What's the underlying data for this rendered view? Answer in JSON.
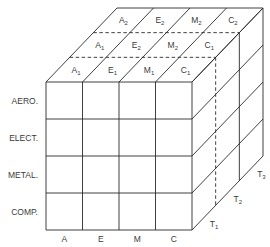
{
  "diagram": {
    "type": "3d-cube-matrix",
    "row_labels": [
      "AERO.",
      "ELECT.",
      "METAL.",
      "COMP."
    ],
    "column_labels": [
      "A",
      "E",
      "M",
      "C"
    ],
    "depth_labels": [
      {
        "base": "T",
        "sub": "1"
      },
      {
        "base": "T",
        "sub": "2"
      },
      {
        "base": "T",
        "sub": "3"
      }
    ],
    "top_layers": [
      {
        "cells": [
          {
            "base": "A",
            "sub": "1"
          },
          {
            "base": "E",
            "sub": "1"
          },
          {
            "base": "M",
            "sub": "1"
          },
          {
            "base": "C",
            "sub": "1"
          }
        ]
      },
      {
        "cells": [
          {
            "base": "A",
            "sub": "1"
          },
          {
            "base": "E",
            "sub": "2"
          },
          {
            "base": "M",
            "sub": "2"
          },
          {
            "base": "C",
            "sub": "1"
          }
        ]
      },
      {
        "cells": [
          {
            "base": "A",
            "sub": "2"
          },
          {
            "base": "E",
            "sub": "2"
          },
          {
            "base": "M",
            "sub": "2"
          },
          {
            "base": "C",
            "sub": "2"
          }
        ]
      }
    ],
    "colors": {
      "line": "#2a2a2a",
      "text": "#3a3a3a",
      "background": "#ffffff"
    }
  }
}
